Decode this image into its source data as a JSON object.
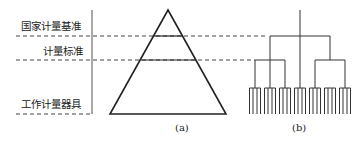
{
  "diagram": {
    "labels": {
      "level1": "国家计量基准",
      "level2": "计量标准",
      "level3": "工作计量器具"
    },
    "captions": {
      "a": "(a)",
      "b": "(b)"
    },
    "colors": {
      "stroke": "#222222",
      "dash": "#444444",
      "background": "#ffffff"
    }
  }
}
